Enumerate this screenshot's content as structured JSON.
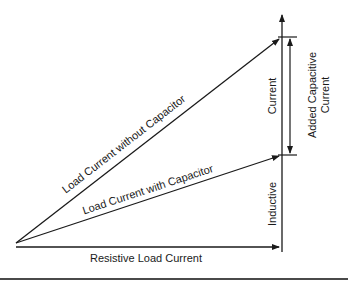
{
  "diagram": {
    "labels": {
      "load_without_cap": "Load Current without Capacitor",
      "load_with_cap": "Load Current with Capacitor",
      "resistive": "Resistive Load Current",
      "inductive_top": "Current",
      "inductive_bottom": "Inductive",
      "added_cap_line1": "Added Capacitive",
      "added_cap_line2": "Current"
    },
    "colors": {
      "line": "#1a1a1a",
      "background": "#ffffff",
      "rule": "#4a4a4a"
    }
  }
}
